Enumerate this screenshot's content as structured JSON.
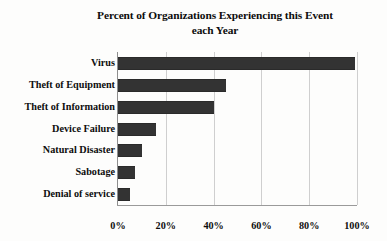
{
  "chart_data": {
    "type": "bar",
    "orientation": "horizontal",
    "title": "Percent of Organizations Experiencing this Event each Year",
    "title_lines": [
      "Percent of Organizations Experiencing this Event",
      "each Year"
    ],
    "xlabel": "",
    "ylabel": "",
    "categories": [
      "Virus",
      "Theft of Equipment",
      "Theft of Information",
      "Device Failure",
      "Natural Disaster",
      "Sabotage",
      "Denial of service"
    ],
    "values": [
      99,
      45,
      40,
      16,
      10,
      7,
      5
    ],
    "value_unit": "%",
    "xlim": [
      0,
      100
    ],
    "xticks": [
      0,
      20,
      40,
      60,
      80,
      100
    ],
    "xtick_labels": [
      "0%",
      "20%",
      "40%",
      "60%",
      "80%",
      "100%"
    ],
    "grid": true,
    "grid_axis": "x",
    "legend": false,
    "bar_color": "#333333",
    "gridline_color": "#cfcfcf",
    "axis_color": "#8e8e8e",
    "background_color": "#fdfdfc"
  }
}
